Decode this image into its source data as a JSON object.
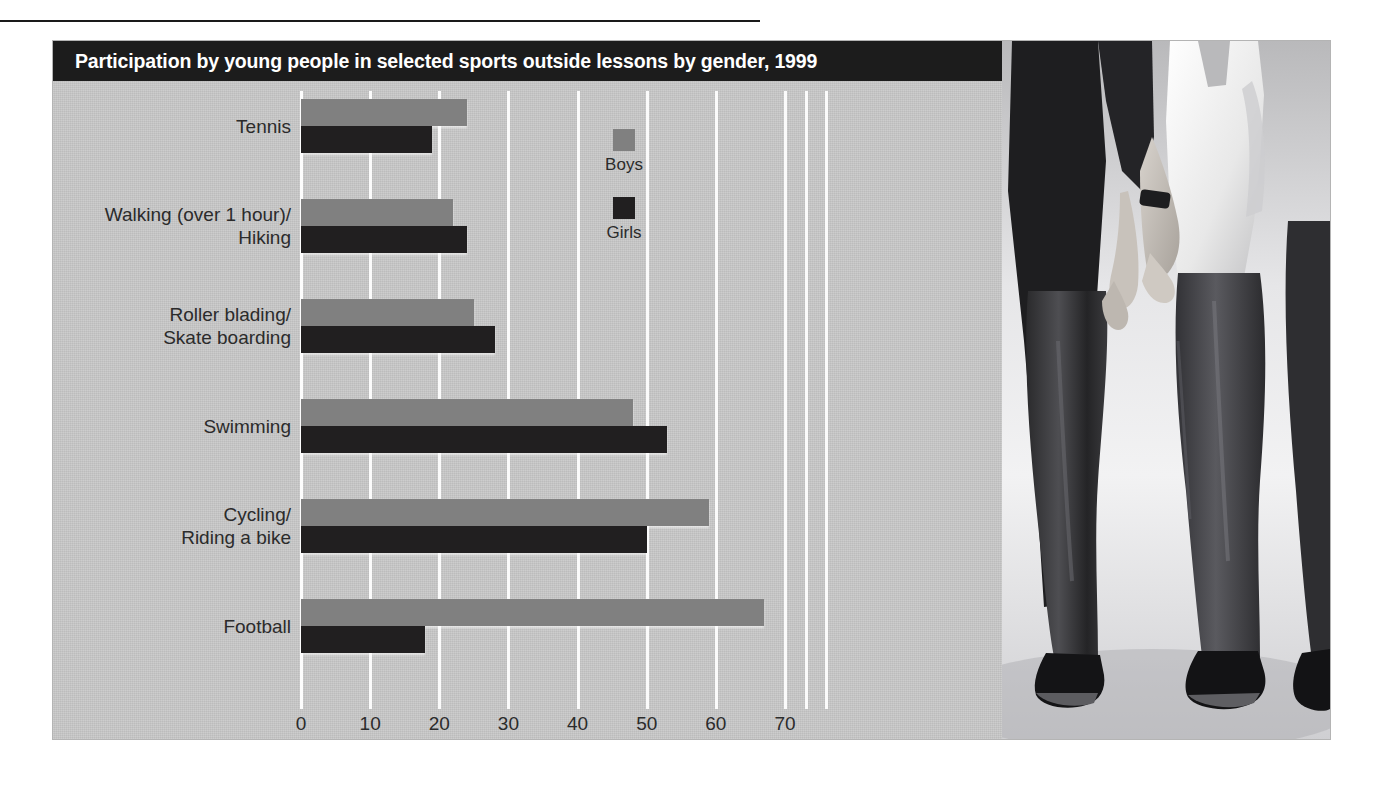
{
  "figure": {
    "title": "Participation by young people in selected sports outside lessons by gender, 1999",
    "colors": {
      "title_bar": "#1c1c1c",
      "boys": "#808080",
      "girls": "#211f20",
      "plot_background": "#c9c9c9",
      "gridline": "#fbfbfb"
    }
  },
  "legend": {
    "items": [
      {
        "label": "Boys",
        "color": "#808080"
      },
      {
        "label": "Girls",
        "color": "#211f20"
      }
    ]
  },
  "axis": {
    "ticks": [
      "0",
      "10",
      "20",
      "30",
      "40",
      "50",
      "60",
      "70"
    ]
  },
  "chart_data": {
    "type": "bar",
    "orientation": "horizontal",
    "title": "Participation by young people in selected sports outside lessons by gender, 1999",
    "xlabel": "",
    "ylabel": "",
    "xlim": [
      0,
      70
    ],
    "grid": true,
    "legend_position": "inside-right",
    "categories": [
      "Tennis",
      "Walking (over 1 hour)/\nHiking",
      "Roller blading/\nSkate boarding",
      "Swimming",
      "Cycling/\nRiding a bike",
      "Football"
    ],
    "series": [
      {
        "name": "Boys",
        "color": "#808080",
        "values": [
          24,
          22,
          25,
          48,
          59,
          67
        ]
      },
      {
        "name": "Girls",
        "color": "#211f20",
        "values": [
          19,
          24,
          28,
          53,
          50,
          18
        ]
      }
    ]
  }
}
